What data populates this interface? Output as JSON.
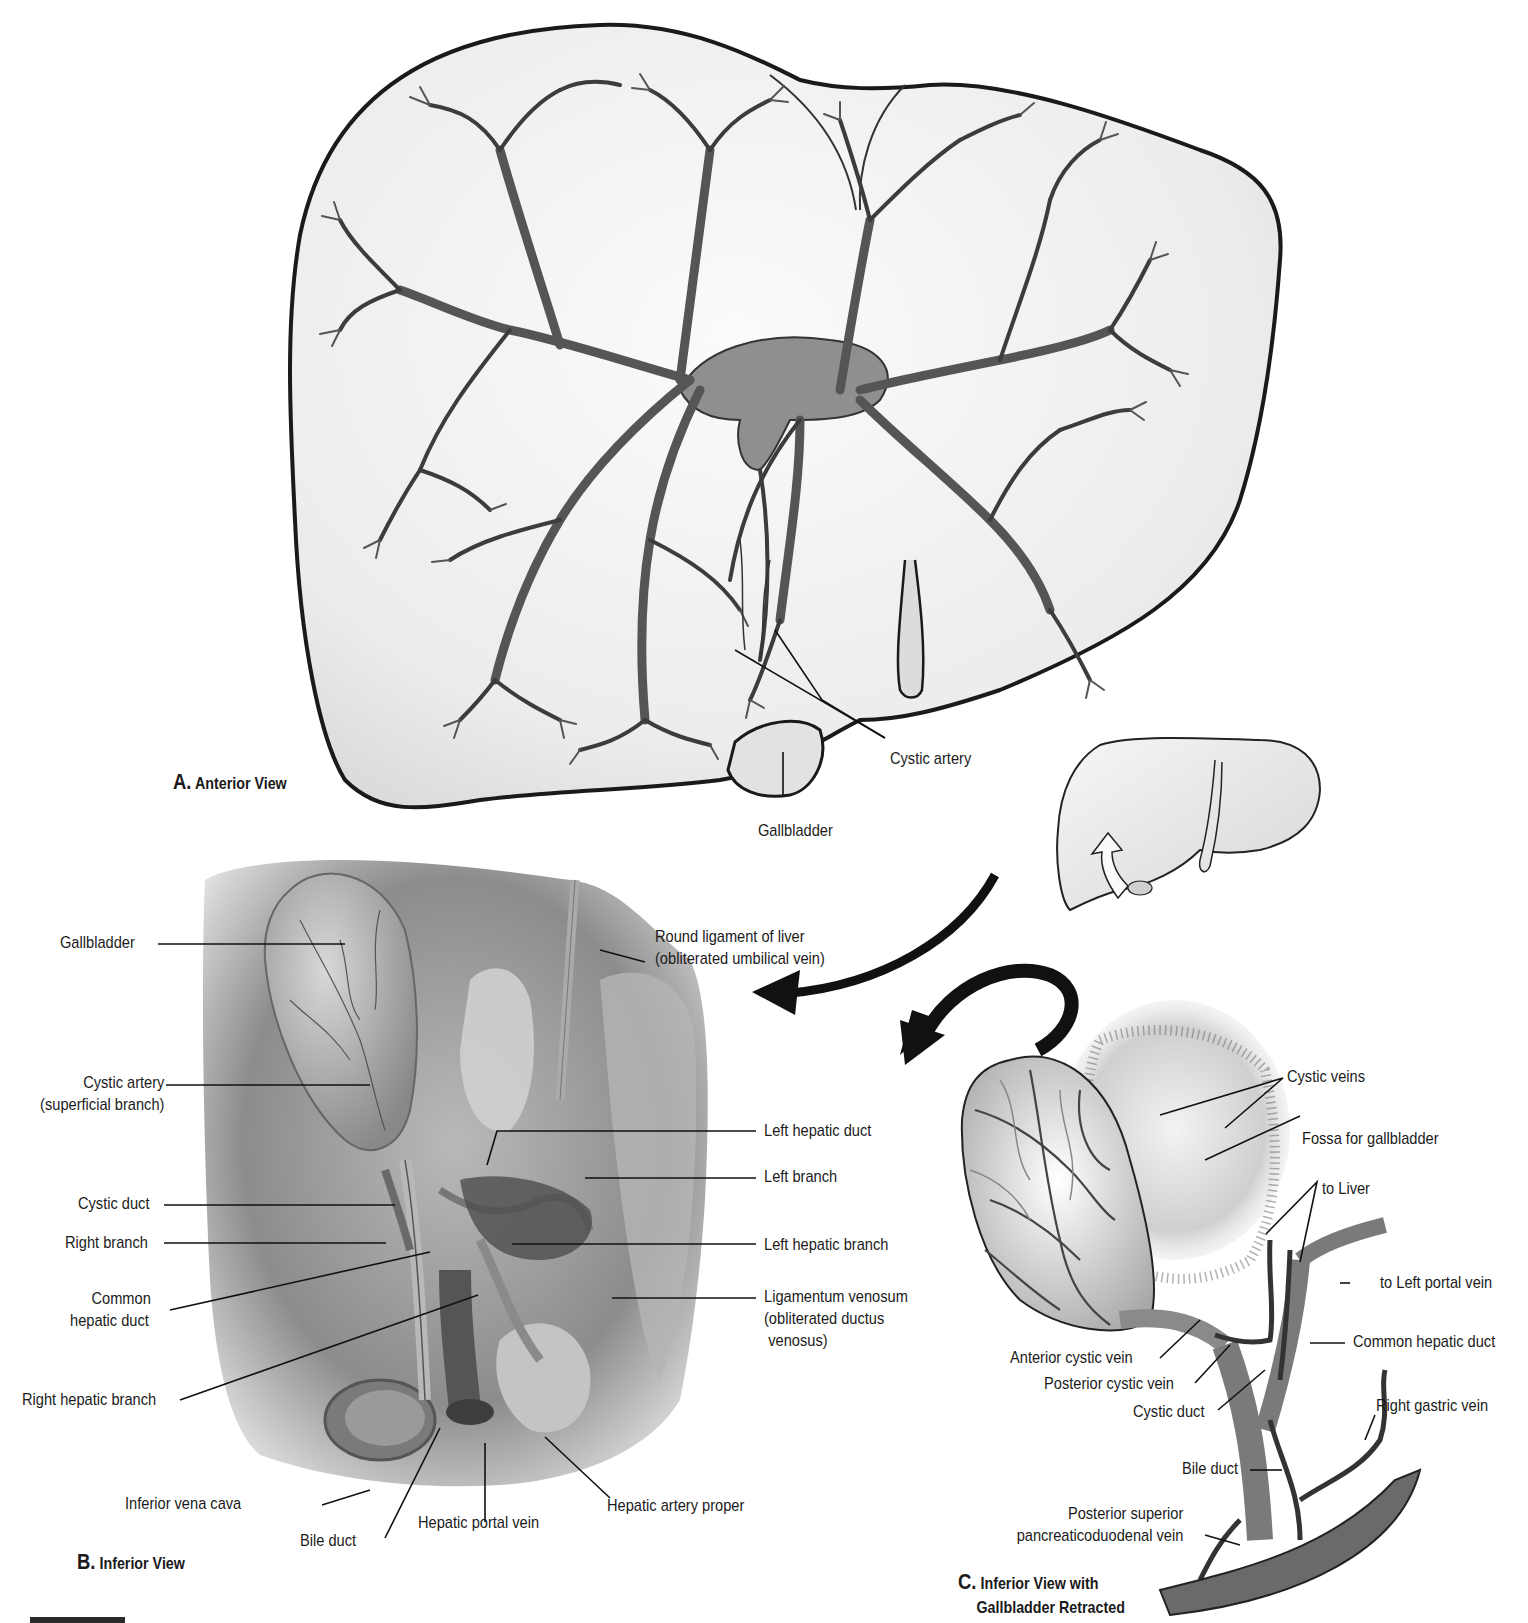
{
  "figure": {
    "panels": [
      {
        "id": "A",
        "letter": "A.",
        "caption": "Anterior View",
        "labels": {
          "cystic_artery": "Cystic artery",
          "gallbladder": "Gallbladder"
        }
      },
      {
        "id": "B",
        "letter": "B.",
        "caption": "Inferior View",
        "labels": {
          "gallbladder": "Gallbladder",
          "round_ligament_l1": "Round ligament of liver",
          "round_ligament_l2": "(obliterated umbilical vein)",
          "cystic_artery_l1": "Cystic artery",
          "cystic_artery_l2": "(superficial branch)",
          "left_hepatic_duct": "Left hepatic duct",
          "cystic_duct": "Cystic duct",
          "left_branch": "Left branch",
          "right_branch": "Right branch",
          "common_hepatic_duct_l1": "Common",
          "common_hepatic_duct_l2": "hepatic duct",
          "left_hepatic_branch": "Left hepatic branch",
          "right_hepatic_branch": "Right hepatic branch",
          "ligamentum_venosum_l1": "Ligamentum venosum",
          "ligamentum_venosum_l2": "(obliterated ductus",
          "ligamentum_venosum_l3": "venosus)",
          "inferior_vena_cava": "Inferior vena cava",
          "bile_duct": "Bile duct",
          "hepatic_portal_vein": "Hepatic portal vein",
          "hepatic_artery_proper": "Hepatic artery proper"
        }
      },
      {
        "id": "C",
        "letter": "C.",
        "caption_l1": "Inferior View with",
        "caption_l2": "Gallbladder Retracted",
        "labels": {
          "cystic_veins": "Cystic veins",
          "fossa_for_gallbladder": "Fossa for gallbladder",
          "to_liver": "to Liver",
          "to_left_portal_vein": "to Left portal vein",
          "common_hepatic_duct": "Common hepatic duct",
          "anterior_cystic_vein": "Anterior cystic vein",
          "posterior_cystic_vein": "Posterior cystic vein",
          "cystic_duct": "Cystic duct",
          "right_gastric_vein": "Right gastric vein",
          "bile_duct": "Bile duct",
          "post_sup_panc_l1": "Posterior superior",
          "post_sup_panc_l2": "pancreaticoduodenal vein"
        }
      }
    ],
    "orientation_icon": "liver-rotate-inferior-icon",
    "colors": {
      "outline": "#1a1a1a",
      "liver_fill": "#eeeeee",
      "vessel_fill": "#9a9a9a",
      "vessel_stroke": "#3a3a3a",
      "shadow": "#6e6e6e"
    }
  }
}
